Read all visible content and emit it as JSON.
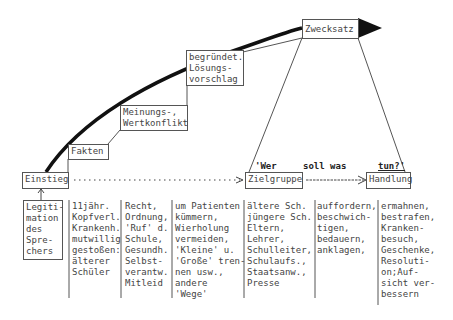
{
  "diagram": {
    "steps": [
      {
        "id": "einstieg",
        "label": "Einstieg"
      },
      {
        "id": "fakten",
        "label": "Fakten"
      },
      {
        "id": "konflikt",
        "label": "Meinungs-,\nWertkonflikt"
      },
      {
        "id": "loesung",
        "label": "begründet.\nLösungs-\nvorschlag"
      },
      {
        "id": "zwecksatz",
        "label": "Zwecksatz"
      }
    ],
    "zielgruppe": "Zielgruppe",
    "handlung": "Handlung",
    "question": {
      "part1": "'Wer",
      "part2": "soll was",
      "part3": "tun?'"
    },
    "legitimation": "Legiti-\nmation\ndes\nSpre-\nchers",
    "columns": [
      {
        "name": "fakten-examples",
        "text": "11jähr.\nKopfverl.\nKrankenh.\nmutwillig\ngestoßen:\nälterer\nSchüler"
      },
      {
        "name": "konflikt-examples",
        "text": "Recht,\nOrdnung,\n'Ruf' d.\nSchule,\nGesundh.\nSelbst-\nverantw.\nMitleid"
      },
      {
        "name": "loesung-examples",
        "text": "um Patienten\nkümmern,\nWierholung\nvermeiden,\n'Kleine' u.\n'Große' tren-\nnen usw.,\nandere\n'Wege'"
      },
      {
        "name": "zielgruppe-examples",
        "text": "ältere Sch.\njüngere Sch.\nEltern,\nLehrer,\nSchulleiter,\nSchulaufs.,\nStaatsanw.,\nPresse"
      },
      {
        "name": "verben-examples",
        "text": "auffordern,\nbeschwich-\ntigen,\nbedauern,\nanklagen,"
      },
      {
        "name": "handlung-examples",
        "text": "ermahnen,\nbestrafen,\nKranken-\nbesuch,\nGeschenke,\nResoluti-\non;Auf-\nsicht ver-\nbessern"
      }
    ]
  }
}
